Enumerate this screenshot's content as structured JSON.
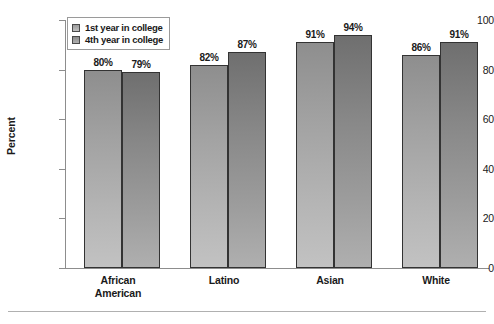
{
  "chart_data": {
    "type": "bar",
    "title": "",
    "xlabel": "",
    "ylabel": "Percent",
    "ylim": [
      0,
      100
    ],
    "yticks": [
      0,
      20,
      40,
      60,
      80,
      100
    ],
    "ytick_labels": [
      "0",
      "20",
      "40",
      "60",
      "80",
      "100"
    ],
    "grid": false,
    "legend_position": "top-left",
    "value_suffix": "%",
    "categories": [
      "African American",
      "Latino",
      "Asian",
      "White"
    ],
    "category_lines": [
      [
        "African",
        "American"
      ],
      [
        "Latino"
      ],
      [
        "Asian"
      ],
      [
        "White"
      ]
    ],
    "series": [
      {
        "name": "1st year in college",
        "color": "#a8a8a8",
        "values": [
          80,
          82,
          91,
          86
        ],
        "labels": [
          "80%",
          "82%",
          "91%",
          "86%"
        ]
      },
      {
        "name": "4th year in college",
        "color": "#8c8c8c",
        "values": [
          79,
          87,
          94,
          91
        ],
        "labels": [
          "79%",
          "87%",
          "94%",
          "91%"
        ]
      }
    ]
  },
  "legend": {
    "items": [
      {
        "label": "1st year in college",
        "swatch": "series-1-swatch"
      },
      {
        "label": "4th year in college",
        "swatch": "series-2-swatch"
      }
    ]
  },
  "colors": {
    "axis": "#8d8d8d",
    "bar_outline": "#333333",
    "text": "#1a1a1a",
    "rule": "#b0b0b0"
  }
}
